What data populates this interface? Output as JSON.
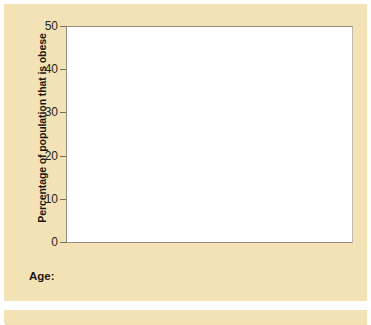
{
  "chart_data": {
    "type": "bar",
    "title": "",
    "xlabel": "",
    "ylabel": "Percentage of population that is obese",
    "categories": [
      "All",
      "Men",
      "Women"
    ],
    "ylim": [
      0,
      50
    ],
    "yticks": [
      0,
      10,
      20,
      30,
      40,
      50
    ],
    "grid": false,
    "legend_title": "Age:",
    "legend_position": "bottom",
    "series": [
      {
        "name": "20 and over",
        "color": "#473a9c",
        "values": [
          36.5,
          34.3,
          38.3
        ]
      },
      {
        "name": "20–39",
        "color": "#3d8ee0",
        "values": [
          32.3,
          30.3,
          34.2
        ]
      },
      {
        "name": "40–59",
        "color": "#7fbb44",
        "values": [
          40.3,
          38.3,
          42.0
        ]
      },
      {
        "name": "60 and over",
        "color": "#cfe3a6",
        "values": [
          37.0,
          34.9,
          38.6
        ]
      }
    ]
  },
  "axis": {
    "y_title": "Percentage of population that is obese",
    "ticks": [
      "50",
      "40",
      "30",
      "20",
      "10",
      "0"
    ]
  },
  "x_categories": [
    {
      "label": "All"
    },
    {
      "label": "Men"
    },
    {
      "label": "Women"
    }
  ],
  "legend": {
    "title": "Age:",
    "items": [
      {
        "label": "20 and over",
        "color": "#473a9c"
      },
      {
        "label": "20–39",
        "color": "#3d8ee0"
      },
      {
        "label": "40–59",
        "color": "#7fbb44"
      },
      {
        "label": "60 and over",
        "color": "#e2efc6"
      }
    ]
  },
  "colors": {
    "background": "#f3e2b6",
    "plot_background": "#ffffff",
    "axis": "#8d8d83",
    "text": "#231f1a"
  }
}
